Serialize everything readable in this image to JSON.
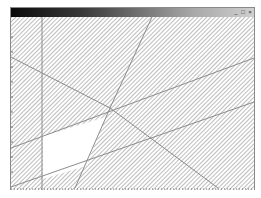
{
  "window": {
    "title": "",
    "controls": {
      "minimize": "_",
      "maximize": "□",
      "close": "×"
    }
  },
  "canvas": {
    "hatch_color": "#a0a0a0",
    "line_color": "#8c8c8c",
    "fill_region_color": "#ffffff"
  }
}
